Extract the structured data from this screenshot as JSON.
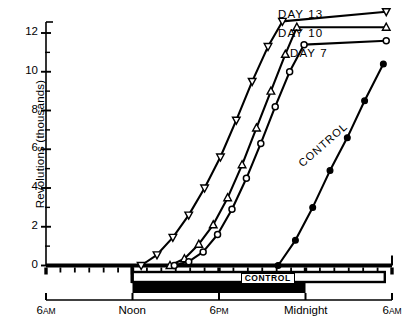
{
  "axes": {
    "ylabel": "Revolutions (thousands)",
    "yticks": [
      0,
      2,
      4,
      6,
      8,
      10,
      12
    ],
    "ylim": [
      0,
      13.4
    ],
    "xlim_hours": [
      6,
      30
    ],
    "xticks": [
      {
        "hour": 6,
        "label": "6",
        "suffix": "AM"
      },
      {
        "hour": 12,
        "label": "Noon",
        "suffix": ""
      },
      {
        "hour": 18,
        "label": "6",
        "suffix": "PM"
      },
      {
        "hour": 24,
        "label": "Midnight",
        "suffix": ""
      },
      {
        "hour": 30,
        "label": "6",
        "suffix": "AM"
      }
    ]
  },
  "bars": {
    "control_box_label": "CONTROL",
    "dark_bar_start_hour": 12,
    "dark_bar_end_hour": 24,
    "box_start_hour": 12,
    "box_end_hour": 29.5
  },
  "legend": [
    {
      "name": "DAY 13",
      "marker": "down-triangle"
    },
    {
      "name": "DAY 10",
      "marker": "up-triangle"
    },
    {
      "name": "DAY 7",
      "marker": "circle"
    },
    {
      "name": "CONTROL",
      "marker": "filled-circle"
    }
  ],
  "chart_data": {
    "type": "line",
    "title": "",
    "xlabel": "",
    "ylabel": "Revolutions (thousands)",
    "ylim": [
      0,
      13.4
    ],
    "grid": false,
    "legend_position": "inline-right",
    "x_unit": "hour of day (6AM = 6, 6AM next day = 30)",
    "series": [
      {
        "name": "DAY 13",
        "marker": "down-triangle",
        "x": [
          12.6,
          13.7,
          14.8,
          15.9,
          17.0,
          18.1,
          19.2,
          20.3,
          21.4,
          22.4,
          29.6
        ],
        "y": [
          0.0,
          0.55,
          1.45,
          2.6,
          4.0,
          5.6,
          7.5,
          9.5,
          11.3,
          12.6,
          13.1
        ]
      },
      {
        "name": "DAY 10",
        "marker": "up-triangle",
        "x": [
          14.6,
          15.6,
          16.6,
          17.6,
          18.6,
          19.6,
          20.6,
          21.6,
          22.6,
          23.4,
          29.6
        ],
        "y": [
          0.0,
          0.35,
          1.1,
          2.1,
          3.5,
          5.2,
          7.1,
          9.0,
          10.9,
          12.3,
          12.3
        ]
      },
      {
        "name": "DAY 7",
        "marker": "circle",
        "x": [
          14.9,
          15.9,
          16.9,
          17.9,
          18.9,
          19.9,
          20.9,
          21.9,
          22.9,
          23.9,
          29.6
        ],
        "y": [
          0.0,
          0.2,
          0.7,
          1.6,
          2.9,
          4.5,
          6.3,
          8.2,
          10.0,
          11.4,
          11.6
        ]
      },
      {
        "name": "CONTROL",
        "marker": "filled-circle",
        "x": [
          22.1,
          23.3,
          24.5,
          25.7,
          26.9,
          28.1,
          29.4
        ],
        "y": [
          0.0,
          1.3,
          3.0,
          4.9,
          6.6,
          8.5,
          10.4
        ]
      }
    ]
  }
}
